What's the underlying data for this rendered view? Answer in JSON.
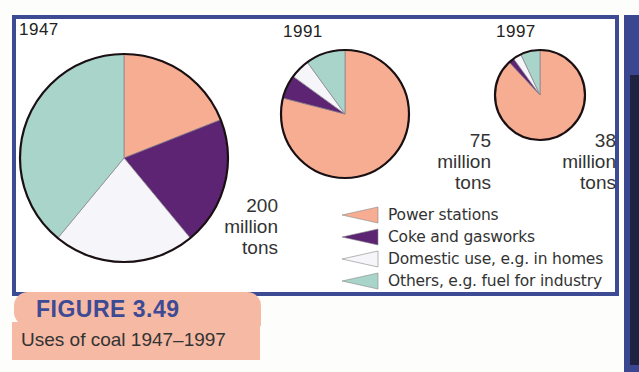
{
  "figure": {
    "number_label": "FIGURE 3.49",
    "caption": "Uses of coal 1947–1997"
  },
  "pies": [
    {
      "year": "1947",
      "total_value": "200",
      "total_unit_1": "million",
      "total_unit_2": "tons"
    },
    {
      "year": "1991",
      "total_value": "75",
      "total_unit_1": "million",
      "total_unit_2": "tons"
    },
    {
      "year": "1997",
      "total_value": "38",
      "total_unit_1": "million",
      "total_unit_2": "tons"
    }
  ],
  "legend": [
    {
      "label": "Power stations",
      "color": "#f6ad92"
    },
    {
      "label": "Coke and gasworks",
      "color": "#5c2472"
    },
    {
      "label": "Domestic use, e.g. in homes",
      "color": "#f5f5fa"
    },
    {
      "label": "Others, e.g. fuel for industry",
      "color": "#a8d4ca"
    }
  ],
  "colors": {
    "frame": "#3d4a94",
    "badge": "#f6b9a4",
    "power": "#f6ad92",
    "coke": "#5c2472",
    "domestic": "#f5f5fa",
    "others": "#a8d4ca"
  },
  "chart_data": {
    "type": "pie",
    "title": "Uses of coal 1947–1997",
    "figure_label": "FIGURE 3.49",
    "categories": [
      "Power stations",
      "Coke and gasworks",
      "Domestic use, e.g. in homes",
      "Others, e.g. fuel for industry"
    ],
    "legend_position": "bottom-right",
    "pies": [
      {
        "year": "1947",
        "total_million_tons": 200,
        "values_percent": [
          19,
          20,
          22,
          39
        ]
      },
      {
        "year": "1991",
        "total_million_tons": 75,
        "values_percent": [
          79,
          6,
          5,
          10
        ]
      },
      {
        "year": "1997",
        "total_million_tons": 38,
        "values_percent": [
          88,
          2,
          3,
          7
        ]
      }
    ],
    "note": "Pie area scaled to total tonnage; slices start at 12 o'clock, clockwise in legend order"
  }
}
